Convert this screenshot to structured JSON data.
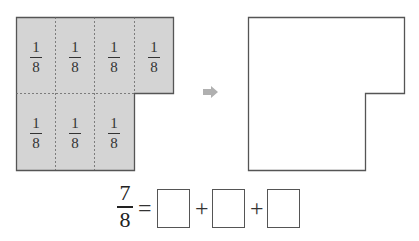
{
  "left_figure": {
    "fill_color": "#d4d4d4",
    "pieces": [
      {
        "numerator": "1",
        "denominator": "8"
      },
      {
        "numerator": "1",
        "denominator": "8"
      },
      {
        "numerator": "1",
        "denominator": "8"
      },
      {
        "numerator": "1",
        "denominator": "8"
      },
      {
        "numerator": "1",
        "denominator": "8"
      },
      {
        "numerator": "1",
        "denominator": "8"
      },
      {
        "numerator": "1",
        "denominator": "8"
      }
    ]
  },
  "arrow": {
    "icon": "right-arrow-icon",
    "color": "#b0b0b0"
  },
  "right_figure": {
    "label": "empty shape to partition"
  },
  "equation": {
    "numerator": "7",
    "denominator": "8",
    "equals": "=",
    "plus": "+",
    "answer_boxes": [
      "",
      "",
      ""
    ]
  }
}
